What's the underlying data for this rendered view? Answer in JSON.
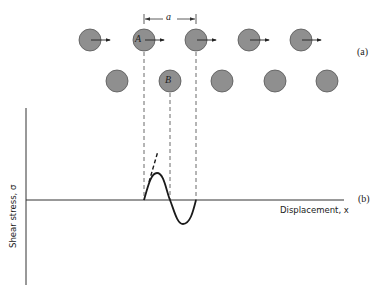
{
  "figure": {
    "panel_a_label": "(a)",
    "panel_b_label": "(b)",
    "spacing_label": "a",
    "atom_A_label": "A",
    "atom_B_label": "B",
    "x_axis_label": "Displacement, x",
    "y_axis_label": "Shear stress, σ",
    "colors": {
      "atom_fill": "#8f8f8f",
      "atom_stroke": "#555555",
      "line": "#333333",
      "curve": "#1a1a1a"
    },
    "top_row_atoms": [
      {
        "cx": 90,
        "cy": 40,
        "arrow": true
      },
      {
        "cx": 144,
        "cy": 40,
        "arrow": true,
        "label": "A"
      },
      {
        "cx": 196,
        "cy": 40,
        "arrow": true
      },
      {
        "cx": 249,
        "cy": 40,
        "arrow": true
      },
      {
        "cx": 301,
        "cy": 40,
        "arrow": true
      }
    ],
    "bottom_row_atoms": [
      {
        "cx": 117,
        "cy": 81
      },
      {
        "cx": 170,
        "cy": 81,
        "label": "B"
      },
      {
        "cx": 222,
        "cy": 81
      },
      {
        "cx": 275,
        "cy": 81
      },
      {
        "cx": 327,
        "cy": 81
      }
    ],
    "curve": {
      "description": "One period of sinusoidal shear stress vs displacement, with dashed initial tangent",
      "start_x": 144,
      "end_x": 196,
      "zero_y": 200,
      "peak": [
        157,
        173
      ],
      "trough": [
        183,
        224
      ]
    }
  }
}
